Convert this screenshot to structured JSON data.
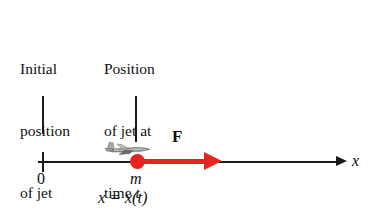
{
  "diagram": {
    "title_text": "",
    "annotations": {
      "initial_position": {
        "lines": [
          "Initial",
          "position",
          "of jet"
        ],
        "full_text": "Initial position of jet"
      },
      "current_position": {
        "lines": [
          "Position",
          "of jet at",
          "time "
        ],
        "italic_variable": "t",
        "full_text": "Position of jet at time t"
      }
    },
    "axis": {
      "label": "x",
      "origin_label": "0",
      "direction": "rightward",
      "color": "#1a1a1a"
    },
    "force_vector": {
      "label": "F",
      "color": "#E8221F",
      "direction": "positive-x"
    },
    "particle": {
      "mass_label": "m",
      "color": "#E8221F",
      "position_expression": "x = x(t)"
    },
    "objects": {
      "jet_icon_name": "airplane-icon"
    }
  }
}
